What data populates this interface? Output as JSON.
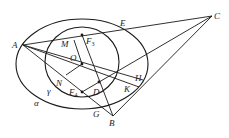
{
  "figure": {
    "curves": {
      "alpha": {
        "label": "α",
        "cx": 82,
        "cy": 64,
        "rx": 66,
        "ry": 45
      },
      "gamma": {
        "label": "γ",
        "cx": 82,
        "cy": 62,
        "rx": 37,
        "ry": 35
      }
    },
    "points": {
      "A": {
        "label": "A",
        "x": 23,
        "y": 45
      },
      "C": {
        "label": "C",
        "x": 212,
        "y": 16
      },
      "B": {
        "label": "B",
        "x": 113,
        "y": 116
      },
      "E": {
        "label": "E",
        "x": 124,
        "y": 28
      },
      "F3": {
        "label": "F",
        "sub": "3",
        "x": 82,
        "y": 35
      },
      "O": {
        "label": "O",
        "x": 82,
        "y": 64
      },
      "M": {
        "label": "M",
        "x": 70,
        "y": 40
      },
      "D": {
        "label": "D",
        "x": 99,
        "y": 82
      },
      "F4": {
        "label": "F",
        "sub": "4",
        "x": 82,
        "y": 92
      },
      "N": {
        "label": "N",
        "x": 60,
        "y": 80
      },
      "H": {
        "label": "H",
        "x": 139,
        "y": 79
      },
      "K": {
        "label": "K",
        "x": 137,
        "y": 86
      },
      "G": {
        "label": "G",
        "x": 107,
        "y": 108
      }
    },
    "labels": {
      "A": "A",
      "C": "C",
      "B": "B",
      "E": "E",
      "F3": "F",
      "F3_sub": "3",
      "F4": "F",
      "F4_sub": "4",
      "M": "M",
      "O": "O",
      "D": "D",
      "N": "N",
      "H": "H",
      "K": "K",
      "G": "G",
      "alpha": "α",
      "gamma": "γ"
    },
    "stroke_color": "#1a1a1a",
    "background": "#ffffff"
  }
}
